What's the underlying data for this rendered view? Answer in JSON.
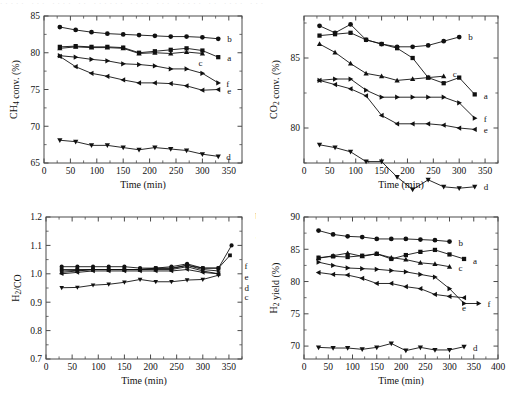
{
  "figure": {
    "top_artifact_text": "····· ··· ···· ·· ······ ···· ··· ····· ·· ···· ···",
    "series_keys": [
      "a",
      "b",
      "c",
      "d",
      "e",
      "f"
    ],
    "marker_shapes": {
      "a": "square",
      "b": "circle",
      "c": "triangle-up",
      "d": "triangle-down",
      "e": "triangle-left",
      "f": "triangle-right"
    },
    "line_color": "#111111"
  },
  "chart_data": [
    {
      "id": "ch4-conversion",
      "type": "line",
      "title": "",
      "xlabel": "Time (min)",
      "ylabel": "CH4 conv. (%)",
      "ylabel_rich": "CH₄ conv. (%)",
      "xlim": [
        0,
        375
      ],
      "ylim": [
        65,
        85
      ],
      "xticks": [
        0,
        50,
        100,
        150,
        200,
        250,
        300,
        350
      ],
      "yticks": [
        65,
        70,
        75,
        80,
        85
      ],
      "grid": false,
      "legend_position": "right-inline",
      "x": [
        30,
        60,
        90,
        120,
        150,
        180,
        210,
        240,
        270,
        300,
        330
      ],
      "series": [
        {
          "name": "a",
          "label": "a",
          "marker": "square",
          "values": [
            80.8,
            80.9,
            80.8,
            80.8,
            80.7,
            80.0,
            80.2,
            80.4,
            80.6,
            80.3,
            79.4
          ]
        },
        {
          "name": "b",
          "label": "b",
          "marker": "circle",
          "values": [
            83.5,
            83.1,
            82.8,
            82.6,
            82.5,
            82.4,
            82.3,
            82.2,
            82.2,
            82.1,
            81.9
          ]
        },
        {
          "name": "c",
          "label": "c",
          "marker": "triangle-up",
          "values": [
            80.6,
            80.8,
            80.7,
            80.7,
            80.6,
            79.9,
            80.0,
            79.9,
            80.1,
            79.9,
            null
          ]
        },
        {
          "name": "d",
          "label": "d",
          "marker": "triangle-down",
          "values": [
            68.1,
            67.9,
            67.4,
            67.4,
            67.1,
            66.8,
            67.1,
            66.9,
            66.7,
            66.2,
            65.9
          ]
        },
        {
          "name": "e",
          "label": "e",
          "marker": "triangle-left",
          "values": [
            79.5,
            78.1,
            77.2,
            76.8,
            76.3,
            75.9,
            75.9,
            75.8,
            75.5,
            74.9,
            75.0
          ]
        },
        {
          "name": "f",
          "label": "f",
          "marker": "triangle-right",
          "values": [
            79.6,
            79.4,
            79.1,
            78.9,
            78.5,
            78.4,
            78.2,
            77.8,
            77.8,
            77.2,
            75.9
          ]
        }
      ]
    },
    {
      "id": "co2-conversion",
      "type": "line",
      "title": "",
      "xlabel": "Time (min)",
      "ylabel": "CO2 conv. (%)",
      "ylabel_rich": "CO₂ conv. (%)",
      "xlim": [
        0,
        375
      ],
      "ylim": [
        77.5,
        88
      ],
      "xticks": [
        0,
        50,
        100,
        150,
        200,
        250,
        300,
        350
      ],
      "yticks": [
        80,
        85
      ],
      "grid": false,
      "legend_position": "right-inline",
      "x": [
        30,
        60,
        90,
        120,
        150,
        180,
        210,
        240,
        270,
        300,
        330
      ],
      "series": [
        {
          "name": "a",
          "label": "a",
          "marker": "square",
          "values": [
            86.6,
            86.7,
            86.8,
            86.3,
            86.0,
            85.7,
            85.0,
            83.6,
            83.2,
            83.6,
            82.4
          ]
        },
        {
          "name": "b",
          "label": "b",
          "marker": "circle",
          "values": [
            87.3,
            86.8,
            87.4,
            86.3,
            86.0,
            85.8,
            85.8,
            85.9,
            86.2,
            86.5,
            null
          ]
        },
        {
          "name": "c",
          "label": "c",
          "marker": "triangle-up",
          "values": [
            86.0,
            85.4,
            84.6,
            83.9,
            83.7,
            83.4,
            83.5,
            83.6,
            83.7,
            null,
            null
          ]
        },
        {
          "name": "d",
          "label": "d",
          "marker": "triangle-down",
          "values": [
            78.8,
            78.6,
            78.3,
            77.6,
            77.6,
            76.5,
            75.6,
            76.3,
            75.8,
            75.7,
            75.8
          ]
        },
        {
          "name": "e",
          "label": "e",
          "marker": "triangle-left",
          "values": [
            83.4,
            83.1,
            82.8,
            82.3,
            80.9,
            80.3,
            80.3,
            80.3,
            80.2,
            80.0,
            79.9
          ]
        },
        {
          "name": "f",
          "label": "f",
          "marker": "triangle-right",
          "values": [
            83.4,
            83.5,
            83.5,
            82.7,
            82.2,
            82.2,
            82.2,
            82.2,
            82.2,
            81.8,
            80.7
          ]
        }
      ]
    },
    {
      "id": "h2-co-ratio",
      "type": "line",
      "title": "",
      "xlabel": "Time (min)",
      "ylabel": "H2/CO",
      "ylabel_rich": "H₂/CO",
      "xlim": [
        0,
        375
      ],
      "ylim": [
        0.7,
        1.2
      ],
      "xticks": [
        0,
        50,
        100,
        150,
        200,
        250,
        300,
        350
      ],
      "yticks": [
        0.7,
        0.8,
        0.9,
        1.0,
        1.1,
        1.2
      ],
      "grid": false,
      "legend_position": "right-fan",
      "x": [
        30,
        60,
        90,
        120,
        150,
        180,
        210,
        240,
        270,
        300,
        330
      ],
      "series": [
        {
          "name": "a",
          "label": "a",
          "marker": "square",
          "values": [
            1.015,
            1.015,
            1.015,
            1.015,
            1.015,
            1.015,
            1.02,
            1.02,
            1.03,
            1.02,
            1.02
          ]
        },
        {
          "name": "b",
          "label": "b",
          "marker": "circle",
          "values": [
            1.025,
            1.025,
            1.025,
            1.025,
            1.025,
            1.02,
            1.02,
            1.025,
            1.035,
            1.02,
            1.02
          ]
        },
        {
          "name": "c",
          "label": "c",
          "marker": "triangle-up",
          "values": [
            1.005,
            1.01,
            1.015,
            1.015,
            1.015,
            1.015,
            1.015,
            1.015,
            1.025,
            1.01,
            1.0
          ]
        },
        {
          "name": "d",
          "label": "d",
          "marker": "triangle-down",
          "values": [
            0.951,
            0.952,
            0.96,
            0.963,
            0.97,
            0.98,
            0.972,
            0.972,
            0.978,
            0.98,
            0.995
          ]
        },
        {
          "name": "e",
          "label": "e",
          "marker": "triangle-left",
          "values": [
            1.0,
            1.005,
            1.01,
            1.01,
            1.01,
            1.01,
            1.01,
            1.01,
            1.015,
            1.005,
            1.0
          ]
        },
        {
          "name": "f",
          "label": "f",
          "marker": "triangle-right",
          "values": [
            1.01,
            1.012,
            1.015,
            1.015,
            1.015,
            1.015,
            1.018,
            1.018,
            1.03,
            1.015,
            1.01
          ]
        }
      ]
    },
    {
      "id": "h2-yield",
      "type": "line",
      "title": "",
      "xlabel": "Time (min)",
      "ylabel": "H2 yield (%)",
      "ylabel_rich": "H₂ yield (%)",
      "xlim": [
        0,
        400
      ],
      "ylim": [
        68,
        90
      ],
      "xticks": [
        0,
        50,
        100,
        150,
        200,
        250,
        300,
        350,
        400
      ],
      "yticks": [
        70,
        75,
        80,
        85,
        90
      ],
      "grid": false,
      "legend_position": "right-inline",
      "x": [
        30,
        60,
        90,
        120,
        150,
        180,
        210,
        240,
        270,
        300,
        330
      ],
      "series": [
        {
          "name": "a",
          "label": "a",
          "marker": "square",
          "values": [
            83.7,
            83.9,
            83.8,
            84.0,
            84.3,
            83.5,
            84.1,
            84.6,
            84.9,
            84.2,
            83.5
          ]
        },
        {
          "name": "b",
          "label": "b",
          "marker": "circle",
          "values": [
            87.9,
            87.3,
            87.0,
            86.9,
            86.6,
            86.6,
            86.6,
            86.5,
            86.4,
            86.2,
            null
          ]
        },
        {
          "name": "c",
          "label": "c",
          "marker": "triangle-up",
          "values": [
            83.6,
            84.0,
            84.4,
            83.9,
            84.3,
            83.7,
            83.4,
            82.9,
            82.7,
            82.3,
            null
          ]
        },
        {
          "name": "d",
          "label": "d",
          "marker": "triangle-down",
          "values": [
            69.8,
            69.7,
            69.7,
            69.5,
            69.8,
            70.4,
            69.3,
            69.8,
            69.4,
            69.4,
            69.9
          ]
        },
        {
          "name": "e",
          "label": "e",
          "marker": "triangle-left",
          "values": [
            81.4,
            81.1,
            81.0,
            80.5,
            79.7,
            79.7,
            79.2,
            78.9,
            78.0,
            77.7,
            77.5
          ]
        },
        {
          "name": "f",
          "label": "f",
          "marker": "triangle-right",
          "values": [
            83.0,
            82.5,
            82.1,
            82.0,
            81.9,
            81.7,
            81.5,
            81.1,
            80.7,
            78.9,
            76.6
          ]
        }
      ]
    }
  ]
}
